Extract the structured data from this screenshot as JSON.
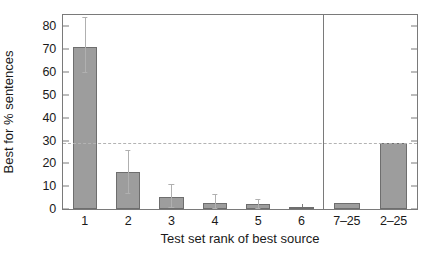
{
  "chart_data": {
    "type": "bar",
    "title": "",
    "xlabel": "Test set rank of best source",
    "ylabel": "Best for % sentences",
    "categories": [
      "1",
      "2",
      "3",
      "4",
      "5",
      "6",
      "7–25",
      "2–25"
    ],
    "values": [
      71,
      16.3,
      5.2,
      2.8,
      2.0,
      0.5,
      2.5,
      29.0
    ],
    "errors_low": [
      60.0,
      7.0,
      1.0,
      0.4,
      0.3,
      null,
      null,
      null
    ],
    "errors_high": [
      84.0,
      26.0,
      11.0,
      6.6,
      4.2,
      null,
      null,
      null
    ],
    "ylim": [
      0,
      85
    ],
    "yticks": [
      0,
      10,
      20,
      30,
      40,
      50,
      60,
      70,
      80
    ],
    "ytick_labels": [
      "0",
      "10",
      "20",
      "30",
      "40",
      "50",
      "60",
      "70",
      "80"
    ],
    "grid": false,
    "legend": "none",
    "reference_line": {
      "y": 29.0,
      "style": "dashed",
      "color": "#b3b3b3"
    },
    "group_separator": {
      "after_category": "6",
      "style": "solid",
      "color": "#7a7a7a"
    },
    "bar_fill_color": "#9d9d9d",
    "bar_edge_color": "#6e6e6e",
    "error_bar_color": "#b0b0b0",
    "axis_color": "#7a7a7a",
    "background_color": "#ffffff"
  }
}
